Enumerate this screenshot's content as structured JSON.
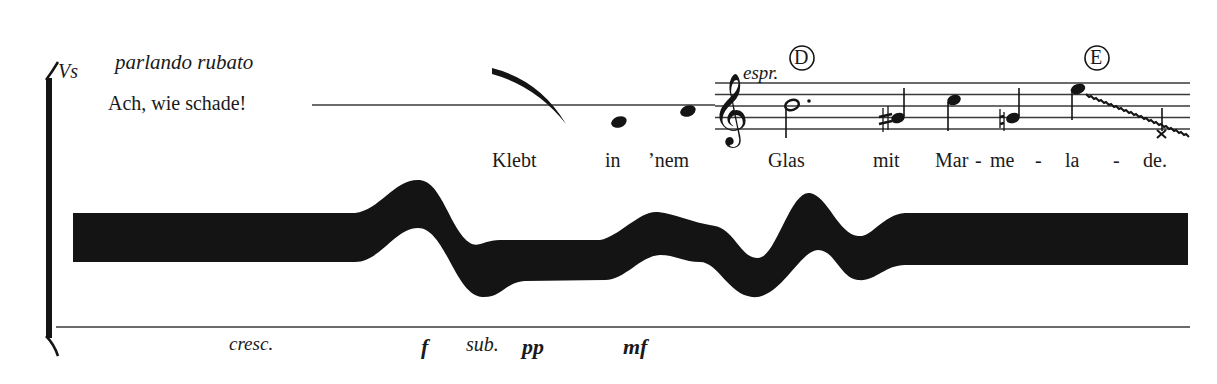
{
  "part": {
    "label": "Vs"
  },
  "directions": {
    "tempo": "parlando rubato",
    "espressivo": "espr.",
    "cresc": "cresc."
  },
  "spoken_text": "Ach, wie schade!",
  "rehearsal_marks": [
    "D",
    "E"
  ],
  "lyrics": [
    "Klebt",
    "in",
    "’nem",
    "Glas",
    "mit",
    "Mar",
    "-",
    "me",
    "-",
    "la",
    "-",
    "de."
  ],
  "dynamics": {
    "forte": "f",
    "subito": "sub.",
    "pianissimo": "pp",
    "mezzoforte": "mf"
  },
  "notation": {
    "clef": "treble",
    "notes": [
      {
        "pitch": "B4",
        "duration": "dotted-half",
        "accidental": null
      },
      {
        "pitch": "G#4",
        "duration": "quarter",
        "accidental": "sharp"
      },
      {
        "pitch": "C5",
        "duration": "quarter",
        "accidental": null
      },
      {
        "pitch": "G4",
        "duration": "quarter",
        "accidental": "natural"
      },
      {
        "pitch": "E5",
        "duration": "quarter",
        "accidental": null,
        "glissando_to": "x-notehead"
      }
    ],
    "graphic_band": "thick black wavy band representing vocal/sound texture"
  },
  "colors": {
    "ink": "#141414",
    "paper": "#ffffff",
    "line": "#3a3a3a"
  }
}
